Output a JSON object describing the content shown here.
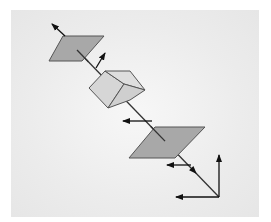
{
  "diagram": {
    "colors": {
      "background": "#eaeaea",
      "plane_fill": "#a8a8a8",
      "cube_fill": "#d8d8d8",
      "stroke": "#333333",
      "arrow": "#111111"
    },
    "elements": {
      "top_plane": {
        "points": "63,36 104,36 82,61 49,61"
      },
      "bottom_plane": {
        "points": "155,127 205,127 175,158 129,158"
      },
      "cube": {
        "left_face": "89,88 105,71 124,84 108,108",
        "top_face": "105,71 130,71 145,90 124,84",
        "right_face": "124,84 145,90 130,100 108,108"
      },
      "axis_line": {
        "x1": 77,
        "y1": 50,
        "x2": 219,
        "y2": 197
      },
      "arrows": [
        {
          "name": "top-plane-normal",
          "x1": 65,
          "y1": 36,
          "x2": 52,
          "y2": 24
        },
        {
          "name": "small-up-arrow",
          "x1": 96,
          "y1": 68,
          "x2": 105,
          "y2": 53
        },
        {
          "name": "mid-left-arrow",
          "x1": 152,
          "y1": 121,
          "x2": 123,
          "y2": 121
        },
        {
          "name": "lower-left-arrow",
          "x1": 191,
          "y1": 165,
          "x2": 167,
          "y2": 165
        },
        {
          "name": "frame-up-arrow",
          "x1": 219,
          "y1": 197,
          "x2": 219,
          "y2": 155
        },
        {
          "name": "frame-left-arrow",
          "x1": 219,
          "y1": 197,
          "x2": 176,
          "y2": 197
        }
      ],
      "axis_mid_arrowhead": {
        "x": 194,
        "y": 171
      }
    }
  }
}
